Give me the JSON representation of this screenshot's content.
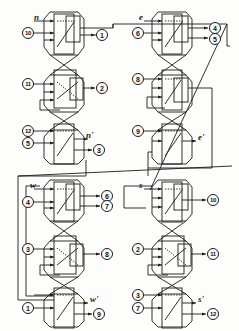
{
  "diagram": {
    "type": "circuit-schematic",
    "stroke_color": "#1a1a1a",
    "background_color": "#fdfdfb",
    "quadrants": [
      {
        "name": "north",
        "input_variable": "n",
        "output_variable": "n'",
        "blocks": [
          {
            "kind": "switch-diagonal",
            "inputs": [
              "n",
              "10"
            ],
            "outputs": [
              "1"
            ]
          },
          {
            "kind": "switch-crossing",
            "inputs": [
              "11"
            ],
            "outputs": [
              "2"
            ]
          },
          {
            "kind": "switch-diagonal",
            "inputs": [
              "12",
              "5"
            ],
            "outputs": [
              "n'",
              "3"
            ]
          }
        ]
      },
      {
        "name": "east",
        "input_variable": "e",
        "output_variable": "e'",
        "blocks": [
          {
            "kind": "switch-diagonal",
            "inputs": [
              "e",
              "6"
            ],
            "outputs": [
              "4",
              "5"
            ]
          },
          {
            "kind": "switch-diagonal",
            "inputs": [
              "8"
            ],
            "outputs": []
          },
          {
            "kind": "switch-diagonal",
            "inputs": [
              "9"
            ],
            "outputs": [
              "e'"
            ]
          }
        ]
      },
      {
        "name": "west",
        "input_variable": "w",
        "output_variable": "w'",
        "blocks": [
          {
            "kind": "switch-diagonal",
            "inputs": [
              "w",
              "4"
            ],
            "outputs": [
              "6",
              "7"
            ]
          },
          {
            "kind": "switch-crossing",
            "inputs": [
              "3"
            ],
            "outputs": [
              "8"
            ]
          },
          {
            "kind": "switch-diagonal",
            "inputs": [
              "1"
            ],
            "outputs": [
              "w'",
              "9"
            ]
          }
        ]
      },
      {
        "name": "south",
        "input_variable": "s",
        "output_variable": "s'",
        "blocks": [
          {
            "kind": "switch-diagonal",
            "inputs": [
              "s"
            ],
            "outputs": [
              "10"
            ]
          },
          {
            "kind": "switch-crossing",
            "inputs": [
              "2"
            ],
            "outputs": [
              "11"
            ]
          },
          {
            "kind": "switch-diagonal",
            "inputs": [
              "3",
              "7"
            ],
            "outputs": [
              "s'",
              "12"
            ]
          }
        ]
      }
    ],
    "variable_labels": {
      "n": "n",
      "n_out": "n'",
      "e": "e",
      "e_out": "e'",
      "w": "w",
      "w_out": "w'",
      "s": "s",
      "s_out": "s'"
    },
    "port_numbers": {
      "n_blk1_in": "10",
      "n_blk1_out": "1",
      "n_blk2_in": "11",
      "n_blk2_out": "2",
      "n_blk3_in_a": "12",
      "n_blk3_in_b": "5",
      "n_blk3_out": "3",
      "e_blk1_in": "6",
      "e_blk1_out_a": "4",
      "e_blk1_out_b": "5",
      "e_blk2_in": "8",
      "e_blk3_in": "9",
      "w_blk1_in": "4",
      "w_blk1_out_a": "6",
      "w_blk1_out_b": "7",
      "w_blk2_in": "3",
      "w_blk2_out": "8",
      "w_blk3_in": "1",
      "w_blk3_out": "9",
      "s_blk1_out": "10",
      "s_blk2_in": "2",
      "s_blk2_out": "11",
      "s_blk3_in_a": "3",
      "s_blk3_in_b": "7",
      "s_blk3_out": "12"
    }
  }
}
